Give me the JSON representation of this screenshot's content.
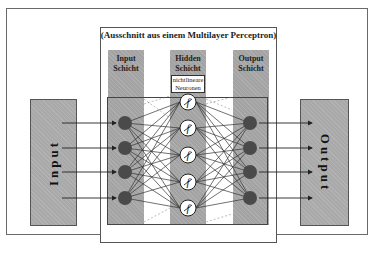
{
  "diagram": {
    "title": "(Ausschnitt aus einem Multilayer Perceptron)",
    "input_block": {
      "label": "Input"
    },
    "output_block": {
      "label": "Output"
    },
    "layers": [
      {
        "name": "input",
        "label_line1": "Input",
        "label_line2": "Schicht",
        "neurons": 4
      },
      {
        "name": "hidden",
        "label_line1": "Hidden",
        "label_line2": "Schicht",
        "neurons": 5,
        "annotation_line1": "nichtlineare",
        "annotation_line2": "Neuronen",
        "neuron_symbol": "f"
      },
      {
        "name": "output",
        "label_line1": "Output",
        "label_line2": "Schicht",
        "neurons": 4
      }
    ],
    "colors": {
      "block_fill": "#a9a9a9",
      "column_fill": "#a3a3a3",
      "neuron_fill": "#4a4a4a",
      "hidden_neuron_fill": "#ffffff",
      "line": "#333333"
    }
  }
}
